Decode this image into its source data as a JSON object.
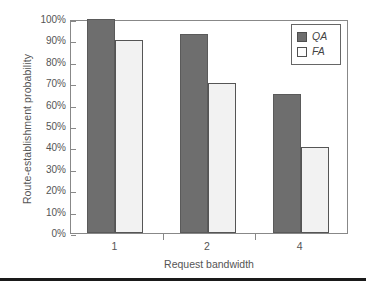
{
  "chart_data": {
    "type": "bar",
    "title": "",
    "xlabel": "Request bandwidth",
    "ylabel": "Route-establishment probability",
    "categories": [
      "1",
      "2",
      "4"
    ],
    "series": [
      {
        "name": "QA",
        "values": [
          100,
          93,
          65
        ],
        "color": "#6e6e6e"
      },
      {
        "name": "FA",
        "values": [
          90,
          70,
          40
        ],
        "color": "#f2f2f2"
      }
    ],
    "ylim": [
      0,
      100
    ],
    "ytick_labels": [
      "100%",
      "90%",
      "80%",
      "70%",
      "60%",
      "50%",
      "40%",
      "30%",
      "20%",
      "10%",
      "0%"
    ],
    "ytick_values": [
      100,
      90,
      80,
      70,
      60,
      50,
      40,
      30,
      20,
      10,
      0
    ],
    "grid": false,
    "legend_position": "top-right",
    "unit": "%"
  },
  "legend": {
    "entries": [
      {
        "label": "QA",
        "swatch": "qa"
      },
      {
        "label": "FA",
        "swatch": "fa"
      }
    ]
  }
}
